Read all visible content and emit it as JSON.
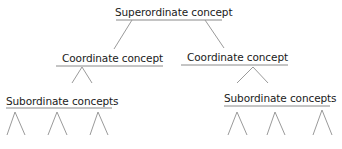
{
  "diagram": {
    "type": "concept-hierarchy",
    "colors": {
      "text": "#1a1a1a",
      "line": "#9a9a9a",
      "underline": "#8a8a8a",
      "background": "#ffffff"
    },
    "nodes": {
      "superordinate": {
        "label": "Superordinate concept"
      },
      "coordinate_left": {
        "label": "Coordinate concept"
      },
      "coordinate_right": {
        "label": "Coordinate concept"
      },
      "subordinate_left": {
        "label": "Subordinate concepts"
      },
      "subordinate_right": {
        "label": "Subordinate concepts"
      }
    },
    "edges": [
      {
        "from": "superordinate",
        "to": "coordinate_left"
      },
      {
        "from": "superordinate",
        "to": "coordinate_right"
      },
      {
        "from": "coordinate_left",
        "to": "subordinate_left"
      },
      {
        "from": "coordinate_right",
        "to": "subordinate_right"
      }
    ],
    "subordinate_branches": {
      "left_count": 3,
      "right_count": 3
    }
  }
}
